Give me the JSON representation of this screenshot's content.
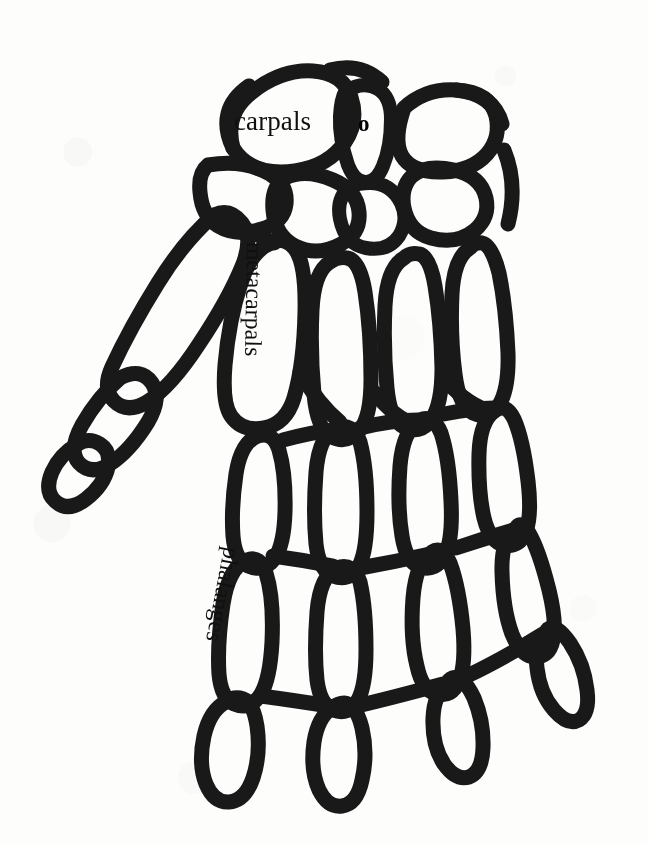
{
  "figure": {
    "style": "black-and-white scanned line illustration",
    "background_color": "#fdfdfc",
    "ink_color": "#191919",
    "bone_fill_color": "#f4f3f0"
  },
  "labels": {
    "carpals": "carpals",
    "metacarpals": "metacarpals",
    "phalanges": "phalanges",
    "marker_o": "o"
  },
  "label_rotation_deg": {
    "carpals": 0,
    "metacarpals": 91,
    "phalanges": 101,
    "marker_o": 0
  },
  "regions": [
    {
      "name": "carpals",
      "description": "wrist bone cluster at top of hand"
    },
    {
      "name": "metacarpals",
      "description": "long palm bones"
    },
    {
      "name": "phalanges",
      "description": "finger bones"
    }
  ]
}
